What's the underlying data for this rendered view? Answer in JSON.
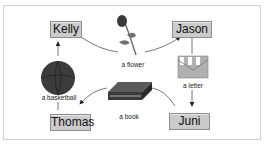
{
  "people": {
    "kelly": "Kelly",
    "jason": "Jason",
    "thomas": "Thomas",
    "juni": "Juni"
  },
  "items": {
    "flower": "a flower",
    "letter": "a letter",
    "basketball": "a basketball",
    "book": "a book"
  },
  "colors": {
    "box_fill": "#cbcbcb",
    "box_border": "#8d8d8d",
    "line": "#555555",
    "frame_border": "#cfcfcf"
  }
}
